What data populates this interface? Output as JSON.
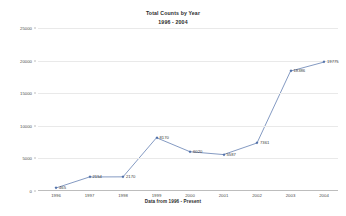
{
  "chart_data": {
    "type": "line",
    "title": "Total Counts by Year",
    "subtitle": "1996 - 2004",
    "xlabel": "Data from 1996 - Present",
    "ylabel": "",
    "categories": [
      "1996",
      "1997",
      "1998",
      "1999",
      "2000",
      "2001",
      "2002",
      "2003",
      "2004"
    ],
    "values": [
      465,
      2154,
      2170,
      8170,
      6020,
      5587,
      7361,
      18386,
      19775
    ],
    "point_labels": [
      "465",
      "2154",
      "2170",
      "8170",
      "6020",
      "5587",
      "7361",
      "18386",
      "19775"
    ],
    "ylim": [
      0,
      25000
    ],
    "y_ticks": [
      "0",
      "5000",
      "10000",
      "15000",
      "20000",
      "25000"
    ],
    "y_tick_values": [
      0,
      5000,
      10000,
      15000,
      20000,
      25000
    ],
    "grid": true,
    "legend": false,
    "series_color": "#4f6fa8",
    "grid_color": "#e9e9e9",
    "axis_color": "#bdbdbd",
    "background": "#ffffff"
  }
}
